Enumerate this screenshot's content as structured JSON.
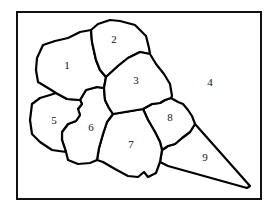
{
  "diagram": {
    "type": "numbered-region-map",
    "frame": {
      "x": 17,
      "y": 12,
      "width": 244,
      "height": 187
    },
    "colors": {
      "stroke": "#000000",
      "fill": "#ffffff",
      "background": "#ffffff"
    },
    "regions": [
      {
        "id": "1",
        "label": "1",
        "label_x": 67,
        "label_y": 66
      },
      {
        "id": "2",
        "label": "2",
        "label_x": 114,
        "label_y": 40
      },
      {
        "id": "3",
        "label": "3",
        "label_x": 136,
        "label_y": 81
      },
      {
        "id": "4",
        "label": "4",
        "label_x": 210,
        "label_y": 83
      },
      {
        "id": "5",
        "label": "5",
        "label_x": 54,
        "label_y": 121
      },
      {
        "id": "6",
        "label": "6",
        "label_x": 91,
        "label_y": 128
      },
      {
        "id": "7",
        "label": "7",
        "label_x": 131,
        "label_y": 145
      },
      {
        "id": "8",
        "label": "8",
        "label_x": 170,
        "label_y": 118
      },
      {
        "id": "9",
        "label": "9",
        "label_x": 205,
        "label_y": 158
      }
    ]
  }
}
